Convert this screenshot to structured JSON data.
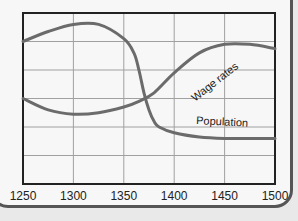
{
  "chart_data": {
    "type": "line",
    "title": "",
    "xlabel": "",
    "ylabel": "",
    "xlim": [
      1250,
      1500
    ],
    "ylim": [
      0,
      6
    ],
    "grid": true,
    "x_ticks": [
      "1250",
      "1300",
      "1350",
      "1400",
      "1450",
      "1500"
    ],
    "y_ticks": [],
    "legend": "inline labels on curves",
    "series": [
      {
        "name": "Population",
        "label": "Population",
        "x": [
          1250,
          1275,
          1300,
          1325,
          1350,
          1360,
          1365,
          1370,
          1375,
          1380,
          1385,
          1400,
          1425,
          1450,
          1475,
          1500
        ],
        "values": [
          5.0,
          5.35,
          5.6,
          5.6,
          5.1,
          4.6,
          4.0,
          3.2,
          2.6,
          2.2,
          2.0,
          1.8,
          1.65,
          1.6,
          1.6,
          1.6
        ]
      },
      {
        "name": "Wage rates",
        "label": "Wage rates",
        "x": [
          1250,
          1275,
          1300,
          1325,
          1350,
          1365,
          1380,
          1400,
          1425,
          1450,
          1475,
          1500
        ],
        "values": [
          3.0,
          2.6,
          2.45,
          2.5,
          2.7,
          2.9,
          3.2,
          3.9,
          4.6,
          4.9,
          4.9,
          4.75
        ]
      }
    ],
    "colors": {
      "line": "#666666",
      "grid": "#999999",
      "frame": "#222222"
    }
  }
}
